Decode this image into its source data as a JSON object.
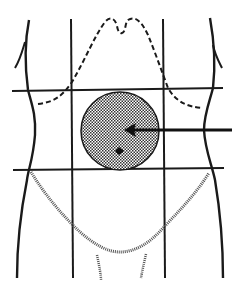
{
  "diagram": {
    "type": "anatomical-illustration",
    "colors": {
      "background": "#ffffff",
      "line": "#1a1a1a",
      "shading": "#808080"
    },
    "grid": {
      "vertical_lines_x": [
        71,
        163
      ],
      "horizontal_lines_y": [
        90,
        170
      ],
      "x_range": [
        12,
        223
      ],
      "y_range": [
        18,
        278
      ]
    },
    "highlighted_region": {
      "shape": "circle",
      "center": [
        120,
        131
      ],
      "radius": 39,
      "fill_pattern": "checkered",
      "navel_marker": [
        119,
        151
      ]
    },
    "arrow": {
      "from": [
        232,
        130
      ],
      "to": [
        124,
        130
      ],
      "direction": "left"
    },
    "labels": []
  }
}
